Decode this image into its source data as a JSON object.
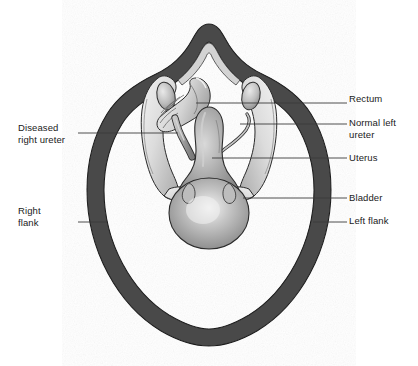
{
  "figure": {
    "type": "anatomical-diagram",
    "background_color": "#ffffff"
  },
  "colors": {
    "body_wall": "#494949",
    "body_wall_outline": "#1f1f1f",
    "bone_light": "#e4e4e4",
    "bone_mid": "#c9c9c9",
    "bone_shadow": "#a8a8a8",
    "organ_gray": "#9d9d9d",
    "organ_light": "#d8d8d8",
    "organ_highlight": "#efefef",
    "rectum_fill": "#dcdcdc",
    "ureter_fill": "#b5b5b5",
    "outline": "#2b2b2b",
    "leader_line": "#3a3a3a",
    "label_text": "#1a1a1a"
  },
  "labels": {
    "right": [
      {
        "id": "rectum",
        "text": "Rectum",
        "leader_from_x": 330,
        "leader_to_x": 347,
        "leader_y": 103
      },
      {
        "id": "normal_left",
        "text": "Normal left\nureter",
        "leader_from_x": 330,
        "leader_to_x": 347,
        "leader_y": 124
      },
      {
        "id": "uterus",
        "text": "Uterus",
        "leader_from_x": 330,
        "leader_to_x": 347,
        "leader_y": 158
      },
      {
        "id": "bladder",
        "text": "Bladder",
        "leader_from_x": 330,
        "leader_to_x": 347,
        "leader_y": 198
      },
      {
        "id": "left_flank",
        "text": "Left flank",
        "leader_from_x": 330,
        "leader_to_x": 347,
        "leader_y": 222
      }
    ],
    "left": [
      {
        "id": "diseased_right_ureter",
        "text": "Diseased\nright ureter",
        "leader_from_x": 78,
        "leader_to_x": 175,
        "leader_y": 133
      },
      {
        "id": "right_flank",
        "text": "Right\nflank",
        "leader_from_x": 78,
        "leader_to_x": 108,
        "leader_y": 222
      }
    ]
  },
  "structures": [
    {
      "name": "body-wall",
      "label": "Flank / abdominal wall"
    },
    {
      "name": "vertebra",
      "label": "Spinous process"
    },
    {
      "name": "pelvic-bone-left",
      "label": "Ilium"
    },
    {
      "name": "pelvic-bone-right",
      "label": "Ilium"
    },
    {
      "name": "ovary-left",
      "label": "Ovary"
    },
    {
      "name": "ovary-right",
      "label": "Ovary"
    },
    {
      "name": "rectum",
      "label": "Rectum"
    },
    {
      "name": "uterus",
      "label": "Uterus"
    },
    {
      "name": "bladder",
      "label": "Bladder"
    },
    {
      "name": "ureter-diseased",
      "label": "Diseased right ureter"
    },
    {
      "name": "ureter-normal",
      "label": "Normal left ureter"
    }
  ]
}
